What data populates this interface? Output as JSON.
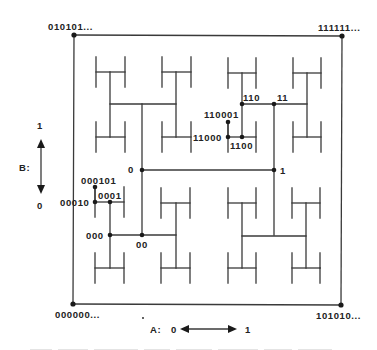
{
  "diagram": {
    "type": "H-tree address mapping",
    "corners": {
      "top_left": "010101...",
      "top_right": "111111...",
      "bottom_left": "000000...",
      "bottom_right": "101010..."
    },
    "nodes": {
      "n0": "0",
      "n1": "1",
      "n00": "00",
      "n000": "000",
      "n0001": "0001",
      "n00010": "00010",
      "n000101": "000101",
      "n11": "11",
      "n110": "110",
      "n1100": "1100",
      "n11000": "11000",
      "n110001": "110001"
    },
    "axis_b": {
      "label": "B:",
      "top": "1",
      "bottom": "0"
    },
    "axis_a": {
      "label": "A:",
      "left": "0",
      "right": "1"
    },
    "colors": {
      "line": "#3a3a3a",
      "node": "#1a1a1a",
      "background": "#ffffff"
    }
  }
}
